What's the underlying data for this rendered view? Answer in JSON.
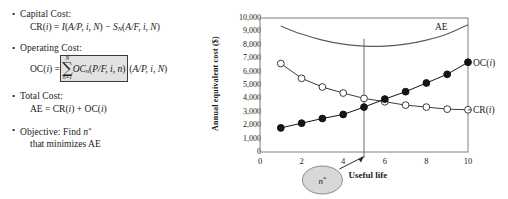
{
  "bullets": [
    {
      "id": "capital-cost",
      "label": "Capital Cost:",
      "formula_html": "CR(<i class='v'>i</i>) = <i class='v'>I</i>(<i class='v'>A/P, i, N</i>) &minus; <i class='v'>S<sub class='s'>N</sub></i>(<i class='v'>A/F, i, N</i>)"
    },
    {
      "id": "operating-cost",
      "label": "Operating Cost:",
      "lhs": "OC(i) =",
      "sigma_top": "N",
      "sigma_bottom": "n=1",
      "sigma_body": "OCn(P/F, i, n)",
      "tail": "(A/P, i, N)"
    },
    {
      "id": "total-cost",
      "label": "Total Cost:",
      "formula_html": "AE = CR(<i class='v'>i</i>) + OC(<i class='v'>i</i>)"
    },
    {
      "id": "objective",
      "label": "Objective: Find n*",
      "second_line": "that minimizes AE"
    }
  ],
  "chart_data": {
    "type": "line",
    "title": "",
    "xlabel": "Useful life",
    "ylabel": "Annual equivalent cost ($)",
    "xlim": [
      0,
      10
    ],
    "ylim": [
      0,
      10000
    ],
    "xticks": [
      "0",
      "2",
      "4",
      "6",
      "8",
      "10"
    ],
    "xtick_values": [
      0,
      2,
      4,
      6,
      8,
      10
    ],
    "yticks": [
      "0",
      "1,000",
      "2,000",
      "3,000",
      "4,000",
      "5,000",
      "6,000",
      "7,000",
      "8,000",
      "9,000",
      "10,000"
    ],
    "ytick_values": [
      0,
      1000,
      2000,
      3000,
      4000,
      5000,
      6000,
      7000,
      8000,
      9000,
      10000
    ],
    "grid": false,
    "legend_position": "right-inline",
    "x": [
      1,
      2,
      3,
      4,
      5,
      6,
      7,
      8,
      9,
      10
    ],
    "series": [
      {
        "name": "CR(i)",
        "label": "CR(i)",
        "marker": "open-circle",
        "color": "#3b3b3b",
        "values": [
          6600,
          5500,
          4850,
          4400,
          4000,
          3750,
          3500,
          3350,
          3200,
          3150
        ]
      },
      {
        "name": "OC(i)",
        "label": "OC(i)",
        "marker": "filled-circle",
        "color": "#151515",
        "values": [
          1800,
          2150,
          2500,
          2800,
          3350,
          3950,
          4500,
          5150,
          5800,
          6700
        ]
      },
      {
        "name": "AE",
        "label": "AE",
        "marker": "none",
        "color": "#5a5a5a",
        "smooth": true,
        "values": [
          9400,
          8800,
          8350,
          8050,
          7900,
          7900,
          8050,
          8350,
          8800,
          9500
        ]
      }
    ],
    "annotations": [
      {
        "id": "n-star",
        "text": "n*",
        "shape": "ellipse",
        "fill": "#d8d8d8"
      },
      {
        "id": "useful-life",
        "text": "Useful life"
      },
      {
        "id": "optimum-marker",
        "text": "",
        "x": 5,
        "note": "vertical line at optimum n*"
      }
    ]
  }
}
